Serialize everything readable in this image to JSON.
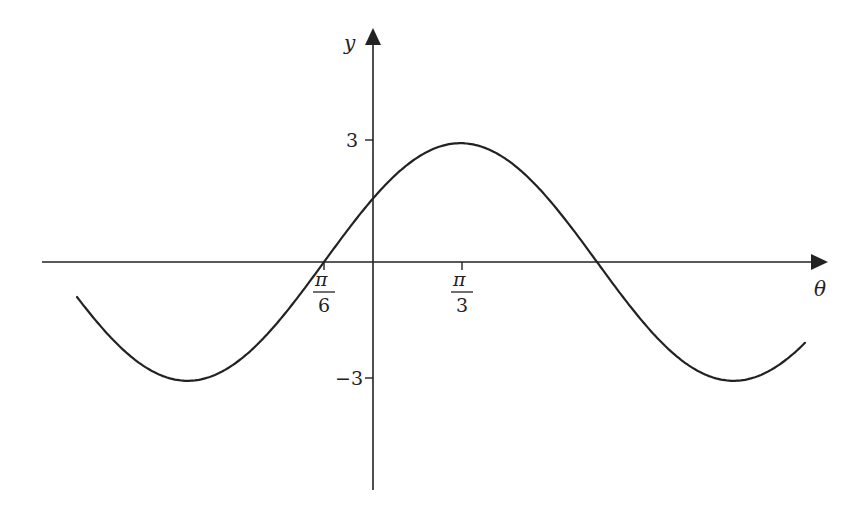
{
  "chart_data": {
    "type": "line",
    "title": "",
    "function": "y = 3 sin(θ + π/6)",
    "xlabel": "θ",
    "ylabel": "y",
    "x_ticks": [
      {
        "label_num": "π",
        "label_den": "6",
        "value": "π/6",
        "note": "x-intercept of curve (shown left of origin)"
      },
      {
        "label_num": "π",
        "label_den": "3",
        "value": "π/3",
        "note": "location of maximum"
      }
    ],
    "y_ticks": [
      {
        "label": "3",
        "value": 3
      },
      {
        "label": "−3",
        "value": -3
      }
    ],
    "ylim": [
      -6,
      5.5
    ],
    "amplitude": 3,
    "key_points": [
      {
        "desc": "x-intercept",
        "x_label": "π/6",
        "y": 0
      },
      {
        "desc": "maximum",
        "x_label": "π/3",
        "y": 3
      },
      {
        "desc": "x-intercept",
        "x_label": "(right)",
        "y": 0
      },
      {
        "desc": "minimum (left)",
        "y": -3
      },
      {
        "desc": "minimum (right)",
        "y": -3
      }
    ],
    "grid": false,
    "legend": null,
    "axis_style": "arrows on positive ends"
  },
  "axes": {
    "x_label": "θ",
    "y_label": "y",
    "tick_3": "3",
    "tick_neg3": "−3",
    "tick_pi": "π",
    "tick_6": "6",
    "tick_3den": "3"
  },
  "colors": {
    "ink": "#222222",
    "background": "#ffffff"
  }
}
